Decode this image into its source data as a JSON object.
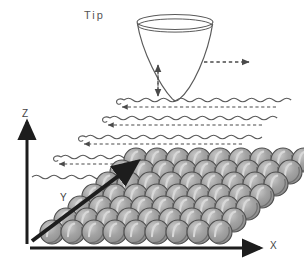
{
  "figure": {
    "kind": "stm-scanning-diagram",
    "background_color": "#ffffff",
    "ink_color": "#4a4a4a",
    "atom_fill": "#9a9a9a",
    "atom_stroke": "#4f4f4f",
    "atom_highlight": "#d8d8d8"
  },
  "labels": {
    "tip": "Tip",
    "z_axis": "Z",
    "y_axis": "Y",
    "x_axis": "X"
  },
  "tip": {
    "shape": "inverted-cone",
    "rim_cx": 175,
    "rim_cy": 22,
    "rim_rx": 38,
    "rim_ry": 7,
    "apex_x": 178,
    "apex_y": 100
  },
  "motion_arrows": {
    "vertical": {
      "name": "z-modulation-arrow",
      "style": "dashed-double-headed",
      "x": 158,
      "y_top": 64,
      "y_bottom": 96
    },
    "horizontal": {
      "name": "scan-direction-arrow",
      "style": "dashed-single-headed",
      "y": 62,
      "x_start": 205,
      "x_end": 252
    }
  },
  "scan_lines": {
    "count": 5,
    "wave_cycles": 10,
    "lines": [
      {
        "x_start": 118,
        "x_end": 294,
        "y": 100,
        "amp": 3.2,
        "retrace_y": 107,
        "retrace_from": 272,
        "retrace_to": 124
      },
      {
        "x_start": 104,
        "x_end": 282,
        "y": 118,
        "amp": 3.2,
        "retrace_y": 125,
        "retrace_from": 258,
        "retrace_to": 110
      },
      {
        "x_start": 80,
        "x_end": 262,
        "y": 137,
        "amp": 3.2,
        "retrace_y": 144,
        "retrace_from": 238,
        "retrace_to": 86
      },
      {
        "x_start": 55,
        "x_end": 240,
        "y": 157,
        "amp": 3.2,
        "retrace_y": 164,
        "retrace_from": 214,
        "retrace_to": 61
      },
      {
        "x_start": 30,
        "x_end": 212,
        "y": 177,
        "amp": 3.2,
        "retrace_y": null,
        "retrace_from": null,
        "retrace_to": null
      }
    ]
  },
  "axes": {
    "z": {
      "x": 27,
      "y_bottom": 243,
      "y_top": 118,
      "thickness": 3
    },
    "x": {
      "y": 248,
      "x_start": 30,
      "x_end": 265,
      "thickness": 3
    },
    "y": {
      "x_start": 32,
      "y_start": 243,
      "x_end": 140,
      "y_end": 160,
      "thickness": 4
    }
  },
  "lattice": {
    "rows": 7,
    "cols": 9,
    "atom_radius": 12,
    "col_dx": 21,
    "row_dx": 14,
    "row_dy": -12,
    "origin_x": 52,
    "origin_y": 232
  }
}
